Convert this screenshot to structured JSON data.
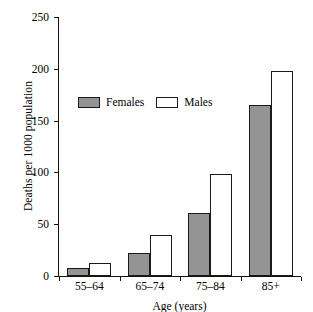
{
  "figure": {
    "cropped_title_remnant": "",
    "background_color": "#ffffff"
  },
  "chart_data": {
    "type": "bar",
    "title": "",
    "xlabel": "Age (years)",
    "ylabel": "Deaths per 1000 population",
    "categories": [
      "55–64",
      "65–74",
      "75–84",
      "85+"
    ],
    "series": [
      {
        "name": "Females",
        "color": "#949494",
        "values": [
          8,
          22,
          61,
          165
        ]
      },
      {
        "name": "Males",
        "color": "#ffffff",
        "values": [
          13,
          40,
          98,
          198
        ]
      }
    ],
    "ylim": [
      0,
      250
    ],
    "yticks": [
      0,
      50,
      100,
      150,
      200,
      250
    ],
    "ytick_labels": [
      "0",
      "50",
      "100",
      "150",
      "200",
      "250"
    ],
    "grid": false,
    "legend_position": "upper-center-left"
  },
  "legend": {
    "entries": [
      {
        "label": "Females",
        "swatch": "filled-gray"
      },
      {
        "label": "Males",
        "swatch": "outlined-white"
      }
    ]
  }
}
